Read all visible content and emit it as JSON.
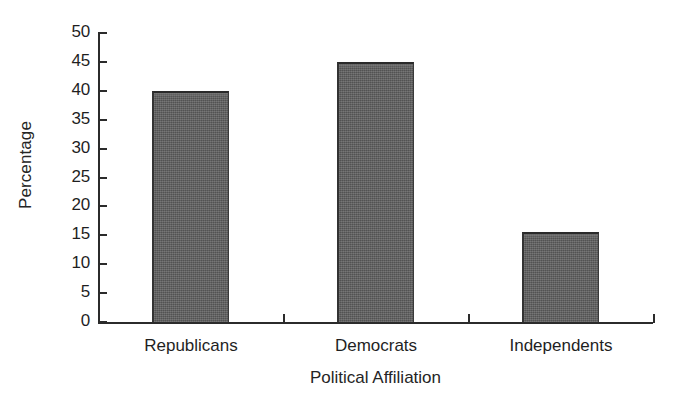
{
  "chart_data": {
    "type": "bar",
    "title": "",
    "xlabel": "Political Affiliation",
    "ylabel": "Percentage",
    "categories": [
      "Republicans",
      "Democrats",
      "Independents"
    ],
    "values": [
      40,
      45,
      15.5
    ],
    "ylim": [
      0,
      50
    ],
    "yticks": [
      0,
      5,
      10,
      15,
      20,
      25,
      30,
      35,
      40,
      45,
      50
    ],
    "ytick_labels": [
      "0",
      "5",
      "10",
      "15",
      "20",
      "25",
      "30",
      "35",
      "40",
      "45",
      "50"
    ],
    "grid": false,
    "legend": "none",
    "bar_color": "#5d5d5d",
    "bar_edge_color": "#2a2a2a",
    "axis_color": "#2b2b2b",
    "background_color": "#ffffff"
  }
}
